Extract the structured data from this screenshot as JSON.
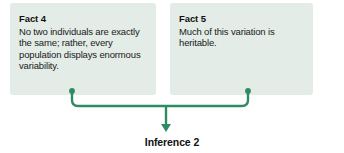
{
  "diagram": {
    "type": "flow-diagram",
    "background_color": "#ffffff",
    "box_fill_color": "#e3ece6",
    "connector_color": "#2e8b63",
    "text_color": "#1a1a1a",
    "boxes": [
      {
        "title": "Fact 4",
        "body": "No two individuals are exactly the same; rather, every population displays enormous variability."
      },
      {
        "title": "Fact 5",
        "body": "Much of this variation is heritable."
      }
    ],
    "conclusion": {
      "label": "Inference 2"
    }
  }
}
